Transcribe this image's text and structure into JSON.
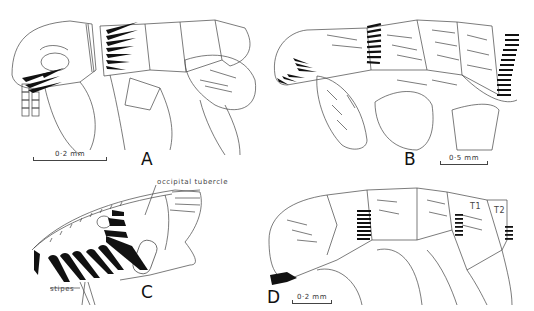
{
  "figure": {
    "panels": [
      {
        "id": "A",
        "label": "A",
        "scale_bar": "0·2 mm"
      },
      {
        "id": "B",
        "label": "B",
        "scale_bar": "0·5 mm"
      },
      {
        "id": "C",
        "label": "C",
        "annotations": [
          "occipital tubercle",
          "stipes"
        ]
      },
      {
        "id": "D",
        "label": "D",
        "scale_bar": "0·2 mm",
        "annotations": [
          "T1",
          "T2"
        ]
      }
    ],
    "colors": {
      "background": "#ffffff",
      "line": "#333333",
      "comb": "#111111"
    }
  }
}
